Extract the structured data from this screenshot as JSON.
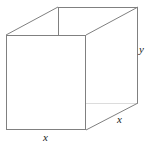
{
  "figure": {
    "name": "open-top-rectangular-box-diagram",
    "background_color": "#ffffff",
    "line_color": "#808080",
    "hidden_line_color": "#d8d8d8",
    "label_color": "#1a1a1a",
    "stroke_width": 1,
    "labels": {
      "base_width": "x",
      "base_depth": "x",
      "height": "y",
      "top_clipped": "x"
    },
    "geometry": {
      "front_top_left": [
        6,
        35
      ],
      "front_top_right": [
        86,
        35
      ],
      "front_bottom_right": [
        86,
        130
      ],
      "front_bottom_left": [
        6,
        130
      ],
      "back_top_left": [
        58,
        7
      ],
      "back_top_right": [
        138,
        7
      ],
      "back_bottom_right": [
        138,
        103
      ],
      "edges": [
        {
          "name": "front-face-left",
          "from": [
            6,
            35
          ],
          "to": [
            6,
            130
          ],
          "hidden": false
        },
        {
          "name": "front-face-bottom",
          "from": [
            6,
            130
          ],
          "to": [
            86,
            130
          ],
          "hidden": false
        },
        {
          "name": "front-face-right",
          "from": [
            86,
            130
          ],
          "to": [
            86,
            35
          ],
          "hidden": false
        },
        {
          "name": "front-face-top",
          "from": [
            86,
            35
          ],
          "to": [
            6,
            35
          ],
          "hidden": false
        },
        {
          "name": "top-left-receding",
          "from": [
            6,
            35
          ],
          "to": [
            58,
            7
          ],
          "hidden": false
        },
        {
          "name": "top-right-receding",
          "from": [
            86,
            35
          ],
          "to": [
            138,
            7
          ],
          "hidden": false
        },
        {
          "name": "back-top-edge",
          "from": [
            58,
            7
          ],
          "to": [
            138,
            7
          ],
          "hidden": false
        },
        {
          "name": "back-right-vertical",
          "from": [
            138,
            7
          ],
          "to": [
            138,
            103
          ],
          "hidden": false
        },
        {
          "name": "bottom-right-receding",
          "from": [
            86,
            130
          ],
          "to": [
            138,
            103
          ],
          "hidden": false
        },
        {
          "name": "back-left-vertical",
          "from": [
            58,
            7
          ],
          "to": [
            58,
            35
          ],
          "hidden": false
        },
        {
          "name": "base-back-right-hidden",
          "from": [
            86,
            103
          ],
          "to": [
            138,
            103
          ],
          "hidden": true
        }
      ]
    }
  }
}
